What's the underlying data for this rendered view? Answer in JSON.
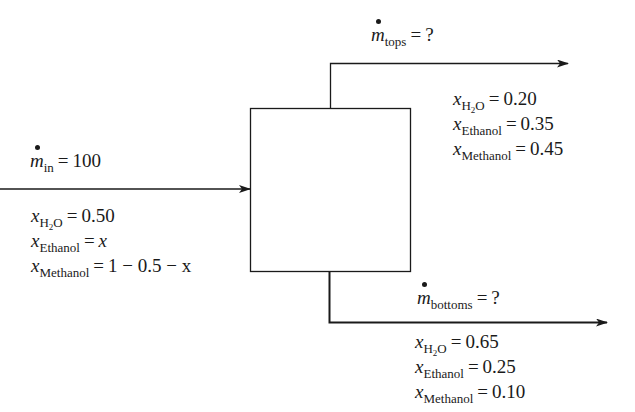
{
  "diagram": {
    "type": "mass-balance-separator",
    "colors": {
      "line": "#1a1a1a",
      "background": "#ffffff"
    },
    "inlet": {
      "flow_symbol": "m",
      "flow_subscript": "in",
      "flow_value": "100",
      "compositions": [
        {
          "symbol": "x",
          "subscript": "H2O",
          "sub_main": "H",
          "sub_num": "2",
          "sub_tail": "O",
          "value": "0.50"
        },
        {
          "symbol": "x",
          "subscript": "Ethanol",
          "value": "x"
        },
        {
          "symbol": "x",
          "subscript": "Methanol",
          "value": "1 − 0.5 − x"
        }
      ]
    },
    "tops": {
      "flow_symbol": "m",
      "flow_subscript": "tops",
      "flow_value": "?",
      "compositions": [
        {
          "symbol": "x",
          "subscript": "H2O",
          "sub_main": "H",
          "sub_num": "2",
          "sub_tail": "O",
          "value": "0.20"
        },
        {
          "symbol": "x",
          "subscript": "Ethanol",
          "value": "0.35"
        },
        {
          "symbol": "x",
          "subscript": "Methanol",
          "value": "0.45"
        }
      ]
    },
    "bottoms": {
      "flow_symbol": "m",
      "flow_subscript": "bottoms",
      "flow_value": "?",
      "compositions": [
        {
          "symbol": "x",
          "subscript": "H2O",
          "sub_main": "H",
          "sub_num": "2",
          "sub_tail": "O",
          "value": "0.65"
        },
        {
          "symbol": "x",
          "subscript": "Ethanol",
          "value": "0.25"
        },
        {
          "symbol": "x",
          "subscript": "Methanol",
          "value": "0.10"
        }
      ]
    },
    "equals": "="
  }
}
